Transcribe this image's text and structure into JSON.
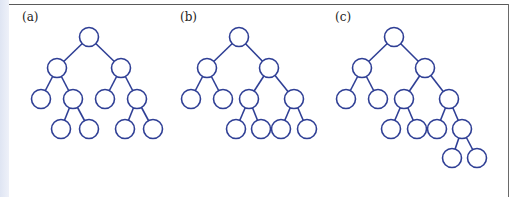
{
  "figure": {
    "colors": {
      "stroke": "#2f3f95",
      "background": "#ffffff",
      "rule": "#5a5a5a"
    },
    "node_radius": 9.5,
    "panels": [
      {
        "label": "(a)",
        "label_pos": [
          22,
          22
        ],
        "nodes": [
          [
            89,
            37
          ],
          [
            57,
            68
          ],
          [
            121,
            68
          ],
          [
            41,
            99
          ],
          [
            73,
            99
          ],
          [
            105,
            99
          ],
          [
            137,
            99
          ],
          [
            61,
            129
          ],
          [
            89,
            129
          ],
          [
            125,
            129
          ],
          [
            153,
            129
          ]
        ],
        "edges": [
          [
            0,
            1
          ],
          [
            0,
            2
          ],
          [
            1,
            3
          ],
          [
            1,
            4
          ],
          [
            2,
            5
          ],
          [
            2,
            6
          ],
          [
            4,
            7
          ],
          [
            4,
            8
          ],
          [
            6,
            9
          ],
          [
            6,
            10
          ]
        ]
      },
      {
        "label": "(b)",
        "label_pos": [
          180,
          22
        ],
        "nodes": [
          [
            239,
            37
          ],
          [
            207,
            68
          ],
          [
            269,
            68
          ],
          [
            191,
            99
          ],
          [
            223,
            99
          ],
          [
            249,
            99
          ],
          [
            294,
            99
          ],
          [
            236,
            129
          ],
          [
            261,
            129
          ],
          [
            281,
            129
          ],
          [
            307,
            129
          ]
        ],
        "edges": [
          [
            0,
            1
          ],
          [
            0,
            2
          ],
          [
            1,
            3
          ],
          [
            1,
            4
          ],
          [
            2,
            5
          ],
          [
            2,
            6
          ],
          [
            5,
            7
          ],
          [
            5,
            8
          ],
          [
            6,
            9
          ],
          [
            6,
            10
          ]
        ]
      },
      {
        "label": "(c)",
        "label_pos": [
          335,
          22
        ],
        "nodes": [
          [
            394,
            37
          ],
          [
            362,
            68
          ],
          [
            425,
            68
          ],
          [
            346,
            99
          ],
          [
            378,
            99
          ],
          [
            404,
            99
          ],
          [
            449,
            99
          ],
          [
            391,
            129
          ],
          [
            417,
            129
          ],
          [
            437,
            129
          ],
          [
            462,
            129
          ],
          [
            452,
            158
          ],
          [
            477,
            158
          ]
        ],
        "edges": [
          [
            0,
            1
          ],
          [
            0,
            2
          ],
          [
            1,
            3
          ],
          [
            1,
            4
          ],
          [
            2,
            5
          ],
          [
            2,
            6
          ],
          [
            5,
            7
          ],
          [
            5,
            8
          ],
          [
            6,
            9
          ],
          [
            6,
            10
          ],
          [
            10,
            11
          ],
          [
            10,
            12
          ]
        ]
      }
    ]
  }
}
